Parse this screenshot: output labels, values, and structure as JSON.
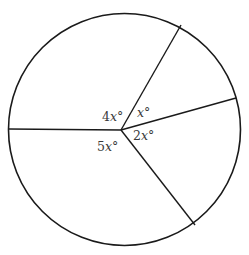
{
  "diagram": {
    "type": "circle-sectors",
    "circle": {
      "cx": 124.5,
      "cy": 129.5,
      "r": 116,
      "stroke": "#1a1a1a",
      "stroke_width": 1.6
    },
    "center_point": {
      "x": 121,
      "y": 130
    },
    "radii": [
      {
        "name": "radius-upper",
        "x2": 181,
        "y2": 25
      },
      {
        "name": "radius-right",
        "x2": 236,
        "y2": 98
      },
      {
        "name": "radius-lower",
        "x2": 195,
        "y2": 225
      },
      {
        "name": "radius-left",
        "x2": 9,
        "y2": 129
      }
    ],
    "labels": [
      {
        "name": "angle-label-4x",
        "coef": "4",
        "var": "x",
        "unit": "°",
        "x": 102,
        "y": 121
      },
      {
        "name": "angle-label-x",
        "coef": "",
        "var": "x",
        "unit": "°",
        "x": 137,
        "y": 117
      },
      {
        "name": "angle-label-2x",
        "coef": "2",
        "var": "x",
        "unit": "°",
        "x": 133,
        "y": 140
      },
      {
        "name": "angle-label-5x",
        "coef": "5",
        "var": "x",
        "unit": "°",
        "x": 97,
        "y": 151
      }
    ]
  }
}
